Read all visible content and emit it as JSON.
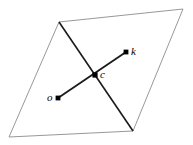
{
  "figure": {
    "name": "parallelogram-with-center-and-two-points",
    "background_color": "#ffffff",
    "width": 193,
    "height": 145,
    "outline": {
      "name": "parallelogram",
      "stroke_color": "#8c8c8c",
      "stroke_width": 0.9,
      "fill": "none",
      "vertices": [
        {
          "name": "top-left",
          "x": 59,
          "y": 22
        },
        {
          "name": "top-right",
          "x": 183,
          "y": 9
        },
        {
          "name": "bottom-right",
          "x": 133,
          "y": 131
        },
        {
          "name": "bottom-left",
          "x": 9,
          "y": 137
        }
      ]
    },
    "segments": [
      {
        "name": "diagonal-topleft-to-bottomright",
        "stroke_color": "#1a1a1a",
        "stroke_width": 1.6,
        "from": {
          "x": 59,
          "y": 22
        },
        "to": {
          "x": 133,
          "y": 131
        }
      },
      {
        "name": "segment-o-to-k",
        "stroke_color": "#1a1a1a",
        "stroke_width": 1.8,
        "from": {
          "x": 58,
          "y": 98
        },
        "to": {
          "x": 126,
          "y": 52
        }
      }
    ],
    "points": [
      {
        "name": "point-o",
        "label": "o",
        "x": 58,
        "y": 98,
        "radius": 2.4,
        "color": "#000000",
        "label_position": "left"
      },
      {
        "name": "point-c",
        "label": "c",
        "x": 95,
        "y": 75,
        "radius": 2.6,
        "color": "#000000",
        "label_position": "right"
      },
      {
        "name": "point-k",
        "label": "k",
        "x": 126,
        "y": 52,
        "radius": 2.4,
        "color": "#000000",
        "label_position": "right"
      }
    ]
  }
}
